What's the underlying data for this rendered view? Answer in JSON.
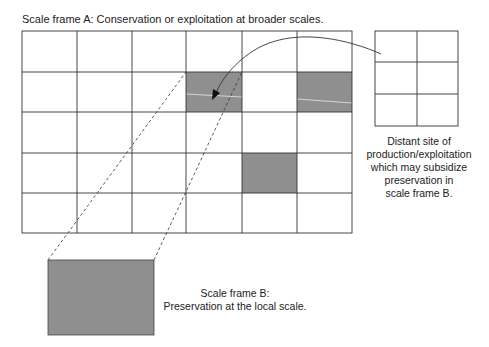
{
  "diagram": {
    "title": "Scale frame A: Conservation or exploitation at broader scales.",
    "grid_a": {
      "rows": 5,
      "cols": 6,
      "shaded_cells": [
        [
          1,
          3
        ],
        [
          1,
          5
        ],
        [
          3,
          4
        ]
      ]
    },
    "distant_site": {
      "rows": 3,
      "cols": 2,
      "caption_lines": [
        "Distant site of",
        "production/exploitation",
        "which may subsidize",
        "preservation in",
        "scale frame B."
      ]
    },
    "frame_b": {
      "caption_lines": [
        "Scale frame B:",
        "Preservation at the local scale."
      ]
    },
    "colors": {
      "shade": "#8f8f8f",
      "line": "#333333"
    }
  }
}
